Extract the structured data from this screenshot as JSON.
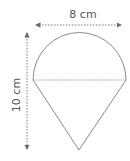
{
  "diagram": {
    "width_label": "8 cm",
    "height_label": "10 cm",
    "colors": {
      "shape_stroke": "#8a8a8a",
      "dimension_line": "#6a6a6a",
      "text": "#555555"
    }
  }
}
